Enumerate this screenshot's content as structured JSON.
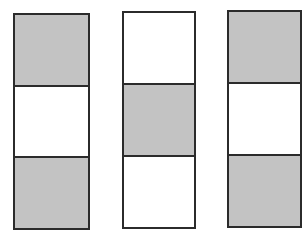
{
  "diagram": {
    "colors": {
      "shaded": "#c3c3c3",
      "empty": "#ffffff",
      "border": "#2b2b2b"
    },
    "columns": [
      {
        "id": "column-1",
        "box": {
          "left": 13,
          "top": 13,
          "width": 77,
          "height": 217
        },
        "cells": [
          "shaded",
          "empty",
          "shaded"
        ]
      },
      {
        "id": "column-2",
        "box": {
          "left": 122,
          "top": 11,
          "width": 74,
          "height": 218
        },
        "cells": [
          "empty",
          "shaded",
          "empty"
        ]
      },
      {
        "id": "column-3",
        "box": {
          "left": 227,
          "top": 10,
          "width": 75,
          "height": 218
        },
        "cells": [
          "shaded",
          "empty",
          "shaded"
        ]
      }
    ]
  }
}
